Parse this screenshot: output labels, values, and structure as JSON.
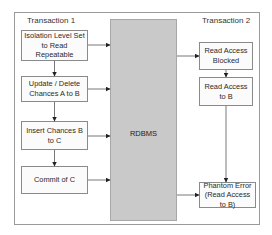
{
  "diagram": {
    "transaction1": {
      "title": "Transaction 1",
      "steps": [
        "Isolation Level Set to Read Repeatable",
        "Update / Delete Chances A to B",
        "Insert Chances B to C",
        "Commit of C"
      ]
    },
    "transaction2": {
      "title": "Transaction 2",
      "steps": [
        "Read Access Blocked",
        "Read Access to B",
        "Phantom Error (Read Access to B)"
      ]
    },
    "center": {
      "label": "RDBMS",
      "fill": "#c9c9c9"
    }
  }
}
